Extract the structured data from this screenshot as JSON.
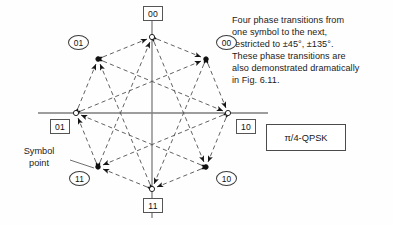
{
  "figure": {
    "title_box": {
      "label": "π/4-QPSK"
    },
    "annotation": {
      "lines": [
        "Four phase transitions from",
        "one symbol to the next,",
        "restricted to ±45°, ±135°.",
        "These phase transitions are",
        "also demonstrated dramatically",
        "in Fig. 6.11."
      ]
    },
    "symbol_callout": {
      "lines": [
        "Symbol",
        "point"
      ]
    },
    "colors": {
      "axis": "#7d7d7d",
      "transition": "#5a5a5a",
      "text": "#1b1b1b",
      "box_border": "#4a4a4a",
      "marker_fill": "#111111"
    },
    "axes": {
      "center": {
        "x": 152,
        "y": 113
      },
      "horizontal": {
        "x1": 38,
        "x2": 268
      },
      "vertical": {
        "y1": 8,
        "y2": 218
      }
    },
    "constellation": {
      "radius": 76,
      "type": "pi/4-QPSK 8-point octagon",
      "points": [
        {
          "id": "p-top",
          "angle_deg": 90,
          "x": 152,
          "y": 37,
          "label": "00",
          "label_style": "boxed",
          "label_x": 143,
          "label_y": 6,
          "marker": "open"
        },
        {
          "id": "p-upper-right",
          "angle_deg": 45,
          "x": 206,
          "y": 59,
          "label": "00",
          "label_style": "circled",
          "label_x": 216,
          "label_y": 35,
          "marker": "filled"
        },
        {
          "id": "p-right",
          "angle_deg": 0,
          "x": 228,
          "y": 113,
          "label": "10",
          "label_style": "boxed",
          "label_x": 236,
          "label_y": 119,
          "marker": "open"
        },
        {
          "id": "p-lower-right",
          "angle_deg": -45,
          "x": 206,
          "y": 167,
          "label": "10",
          "label_style": "circled",
          "label_x": 216,
          "label_y": 171,
          "marker": "filled"
        },
        {
          "id": "p-bottom",
          "angle_deg": -90,
          "x": 152,
          "y": 189,
          "label": "11",
          "label_style": "boxed",
          "label_x": 143,
          "label_y": 198,
          "marker": "open"
        },
        {
          "id": "p-lower-left",
          "angle_deg": -135,
          "x": 98,
          "y": 167,
          "label": "11",
          "label_style": "circled",
          "label_x": 69,
          "label_y": 171,
          "marker": "filled"
        },
        {
          "id": "p-left",
          "angle_deg": 180,
          "x": 76,
          "y": 113,
          "label": "01",
          "label_style": "boxed",
          "label_x": 50,
          "label_y": 119,
          "marker": "open"
        },
        {
          "id": "p-upper-left",
          "angle_deg": 135,
          "x": 98,
          "y": 59,
          "label": "01",
          "label_style": "circled",
          "label_x": 68,
          "label_y": 35,
          "marker": "filled"
        }
      ],
      "transitions_note": "each point connects by dashed arrows to the 4 points at ±45° and ±135°"
    }
  }
}
